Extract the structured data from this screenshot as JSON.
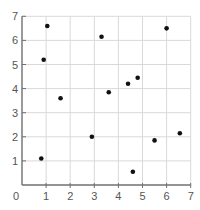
{
  "chart_data": {
    "type": "scatter",
    "title": "",
    "xlabel": "",
    "ylabel": "",
    "xlim": [
      0,
      7
    ],
    "ylim": [
      0,
      7
    ],
    "grid": true,
    "legend": null,
    "x_ticks": [
      "0",
      "1",
      "2",
      "3",
      "4",
      "5",
      "6",
      "7"
    ],
    "y_ticks": [
      "1",
      "2",
      "3",
      "4",
      "5",
      "6",
      "7"
    ],
    "series": [
      {
        "name": "points",
        "points": [
          {
            "x": 1.05,
            "y": 6.6
          },
          {
            "x": 0.9,
            "y": 5.2
          },
          {
            "x": 1.6,
            "y": 3.6
          },
          {
            "x": 0.8,
            "y": 1.1
          },
          {
            "x": 2.9,
            "y": 2.0
          },
          {
            "x": 3.3,
            "y": 6.15
          },
          {
            "x": 3.6,
            "y": 3.85
          },
          {
            "x": 4.4,
            "y": 4.2
          },
          {
            "x": 4.8,
            "y": 4.45
          },
          {
            "x": 6.0,
            "y": 6.5
          },
          {
            "x": 4.6,
            "y": 0.55
          },
          {
            "x": 5.5,
            "y": 1.85
          },
          {
            "x": 6.55,
            "y": 2.15
          }
        ]
      }
    ]
  },
  "style": {
    "grid_color": "#d9d9d9",
    "axis_color": "#707070",
    "point_color": "#111111",
    "label_color": "#555555"
  }
}
